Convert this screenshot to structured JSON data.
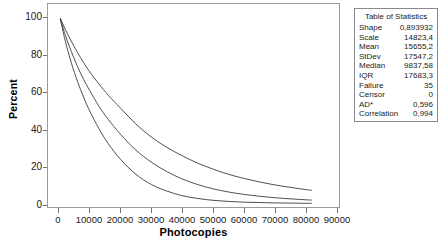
{
  "chart_data": {
    "type": "line",
    "title": "",
    "xlabel": "Photocopies",
    "ylabel": "Percent",
    "xlim": [
      0,
      90000
    ],
    "ylim": [
      0,
      100
    ],
    "xticks": [
      0,
      10000,
      20000,
      30000,
      40000,
      50000,
      60000,
      70000,
      80000,
      90000
    ],
    "xtick_labels": [
      "0",
      "10000",
      "20000",
      "30000",
      "40000",
      "50000",
      "60000",
      "70000",
      "80000",
      "90000"
    ],
    "yticks": [
      0,
      20,
      40,
      60,
      80,
      100
    ],
    "ytick_labels": [
      "0",
      "20",
      "40",
      "60",
      "80",
      "100"
    ],
    "grid": false,
    "legend": "none",
    "series": [
      {
        "name": "Lower 95% CI",
        "color": "#3a3a3a",
        "x": [
          500,
          2000,
          4000,
          6000,
          8000,
          10000,
          13000,
          16000,
          20000,
          25000,
          30000,
          35000,
          40000,
          45000,
          50000,
          55000,
          60000,
          65000,
          70000,
          75000,
          80000,
          82000
        ],
        "y": [
          99.0,
          88.0,
          76.0,
          66.0,
          57.5,
          50.0,
          40.5,
          32.5,
          24.0,
          16.0,
          10.5,
          7.0,
          4.5,
          3.0,
          2.0,
          1.4,
          1.0,
          0.8,
          0.6,
          0.5,
          0.4,
          0.4
        ]
      },
      {
        "name": "Weibull fit",
        "color": "#3a3a3a",
        "x": [
          500,
          2000,
          4000,
          6000,
          8000,
          10000,
          13000,
          16000,
          20000,
          25000,
          30000,
          35000,
          40000,
          45000,
          50000,
          55000,
          60000,
          65000,
          70000,
          75000,
          80000,
          82000
        ],
        "y": [
          99.4,
          91.0,
          82.0,
          74.0,
          67.0,
          61.0,
          52.5,
          45.5,
          37.5,
          29.0,
          22.5,
          17.5,
          13.5,
          10.5,
          8.2,
          6.5,
          5.2,
          4.2,
          3.4,
          2.8,
          2.3,
          2.1
        ]
      },
      {
        "name": "Upper 95% CI",
        "color": "#3a3a3a",
        "x": [
          500,
          2000,
          4000,
          6000,
          8000,
          10000,
          13000,
          16000,
          20000,
          25000,
          30000,
          35000,
          40000,
          45000,
          50000,
          55000,
          60000,
          65000,
          70000,
          75000,
          80000,
          82000
        ],
        "y": [
          99.7,
          94.0,
          87.5,
          81.5,
          76.0,
          71.0,
          64.5,
          58.5,
          51.5,
          43.0,
          36.0,
          30.5,
          26.0,
          22.0,
          18.8,
          16.0,
          13.8,
          11.9,
          10.3,
          9.0,
          7.8,
          7.4
        ]
      }
    ]
  },
  "stats_table": {
    "title": "Table of Statistics",
    "rows": [
      {
        "key": "Shape",
        "value": "0,893932"
      },
      {
        "key": "Scale",
        "value": "14823,4"
      },
      {
        "key": "Mean",
        "value": "15655,2"
      },
      {
        "key": "StDev",
        "value": "17547,2"
      },
      {
        "key": "Median",
        "value": "9837,58"
      },
      {
        "key": "IQR",
        "value": "17683,3"
      },
      {
        "key": "Failure",
        "value": "35"
      },
      {
        "key": "Censor",
        "value": "0"
      },
      {
        "key": "AD*",
        "value": "0,596"
      },
      {
        "key": "Correlation",
        "value": "0,994"
      }
    ]
  },
  "colors": {
    "curve": "#3a3a3a",
    "frame": "#9a9a9a",
    "tick": "#6f6f6f",
    "text": "#1a1a1a"
  }
}
